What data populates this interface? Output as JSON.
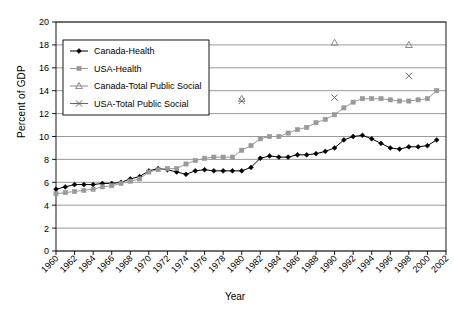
{
  "chart_data": {
    "type": "line",
    "title": "",
    "xlabel": "Year",
    "ylabel": "Percent of GDP",
    "xlim": [
      1960,
      2002
    ],
    "ylim": [
      0,
      20
    ],
    "ytick_step": 2,
    "xtick_step": 2,
    "grid": true,
    "legend_position": "upper-left-inside",
    "xticks": [
      1960,
      1962,
      1964,
      1966,
      1968,
      1970,
      1972,
      1974,
      1976,
      1978,
      1980,
      1982,
      1984,
      1986,
      1988,
      1990,
      1992,
      1994,
      1996,
      1998,
      2000,
      2002
    ],
    "yticks": [
      0,
      2,
      4,
      6,
      8,
      10,
      12,
      14,
      16,
      18,
      20
    ],
    "series": [
      {
        "name": "Canada-Health",
        "marker": "diamond",
        "color": "#000000",
        "mode": "lines+markers",
        "x": [
          1960,
          1961,
          1962,
          1963,
          1964,
          1965,
          1966,
          1967,
          1968,
          1969,
          1970,
          1971,
          1972,
          1973,
          1974,
          1975,
          1976,
          1977,
          1978,
          1979,
          1980,
          1981,
          1982,
          1983,
          1984,
          1985,
          1986,
          1987,
          1988,
          1989,
          1990,
          1991,
          1992,
          1993,
          1994,
          1995,
          1996,
          1997,
          1998,
          1999,
          2000,
          2001
        ],
        "y": [
          5.4,
          5.6,
          5.8,
          5.8,
          5.8,
          5.9,
          5.9,
          6.0,
          6.3,
          6.5,
          7.0,
          7.2,
          7.1,
          6.9,
          6.7,
          7.0,
          7.1,
          7.0,
          7.0,
          7.0,
          7.0,
          7.3,
          8.1,
          8.3,
          8.2,
          8.2,
          8.4,
          8.4,
          8.5,
          8.7,
          9.0,
          9.7,
          10.0,
          10.1,
          9.8,
          9.4,
          9.0,
          8.9,
          9.1,
          9.1,
          9.2,
          9.7
        ]
      },
      {
        "name": "USA-Health",
        "marker": "square",
        "color": "#999999",
        "mode": "lines+markers",
        "x": [
          1960,
          1961,
          1962,
          1963,
          1964,
          1965,
          1966,
          1967,
          1968,
          1969,
          1970,
          1971,
          1972,
          1973,
          1974,
          1975,
          1976,
          1977,
          1978,
          1979,
          1980,
          1981,
          1982,
          1983,
          1984,
          1985,
          1986,
          1987,
          1988,
          1989,
          1990,
          1991,
          1992,
          1993,
          1994,
          1995,
          1996,
          1997,
          1998,
          1999,
          2000,
          2001
        ],
        "y": [
          5.0,
          5.1,
          5.2,
          5.3,
          5.4,
          5.6,
          5.7,
          5.9,
          6.1,
          6.3,
          6.9,
          7.1,
          7.2,
          7.2,
          7.6,
          7.9,
          8.1,
          8.2,
          8.2,
          8.2,
          8.8,
          9.2,
          9.8,
          10.0,
          10.0,
          10.3,
          10.6,
          10.8,
          11.2,
          11.5,
          11.9,
          12.5,
          13.0,
          13.3,
          13.3,
          13.3,
          13.2,
          13.1,
          13.1,
          13.2,
          13.3,
          14.0
        ]
      },
      {
        "name": "Canada-Total Public Social",
        "marker": "triangle",
        "color": "#888888",
        "mode": "markers",
        "x": [
          1980,
          1990,
          1998
        ],
        "y": [
          13.3,
          18.2,
          18.0
        ]
      },
      {
        "name": "USA-Total Public Social",
        "marker": "cross",
        "color": "#666666",
        "mode": "markers",
        "x": [
          1980,
          1990,
          1998
        ],
        "y": [
          13.1,
          13.4,
          15.3
        ]
      }
    ],
    "legend": [
      {
        "label": "Canada-Health",
        "marker": "diamond",
        "color": "#000000"
      },
      {
        "label": "USA-Health",
        "marker": "square",
        "color": "#999999"
      },
      {
        "label": "Canada-Total Public Social",
        "marker": "triangle",
        "color": "#888888"
      },
      {
        "label": "USA-Total Public Social",
        "marker": "cross",
        "color": "#666666"
      }
    ]
  }
}
